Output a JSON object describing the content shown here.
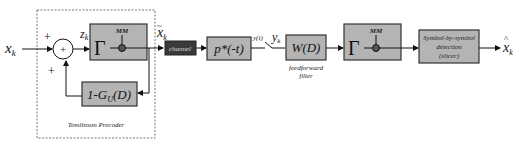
{
  "diagram": {
    "input_label": "x",
    "input_sub": "k",
    "sum_inputs": [
      "+",
      "+"
    ],
    "sum_symbol": "+",
    "z_label": "z",
    "z_sub": "k",
    "modulo_block": {
      "symbol": "Γ",
      "tag": "MM"
    },
    "feedback_block": "1-G",
    "feedback_sub": "U",
    "feedback_arg": "(D)",
    "precoder_caption": "Tomlinson Precoder",
    "xtilde_label": "x",
    "xtilde_sub": "k",
    "channel_label": "channel",
    "matched_filter_label": "p*(-t)",
    "yt_label": "y(t)",
    "yk_label": "y",
    "yk_sub": "k",
    "ff_block": "W(D)",
    "ff_caption_1": "feedforward",
    "ff_caption_2": "filter",
    "modulo2_block": {
      "symbol": "Γ",
      "tag": "MM"
    },
    "slicer_line_1": "Symbol-by-symbol",
    "slicer_line_2": "detection",
    "slicer_line_3": "(slicer)",
    "output_label": "x",
    "output_sub": "k",
    "colors": {
      "block_fill": "#b4b4b4",
      "channel_fill": "#3a3a3a"
    }
  }
}
